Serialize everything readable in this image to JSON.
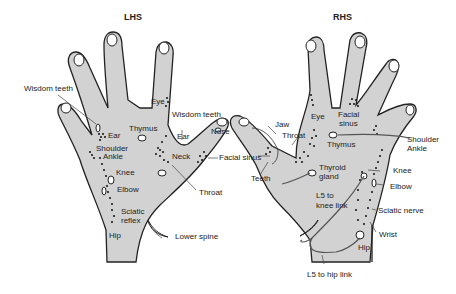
{
  "titles": {
    "left": "LHS",
    "right": "RHS"
  },
  "colors": {
    "hand_fill": "#d2d2d2",
    "outline": "#222222",
    "dots": "#111111",
    "link_line": "#555555"
  },
  "left_hand": {
    "labels": {
      "wisdom_teeth_1": "Wisdom teeth",
      "eye": "Eye",
      "wisdom_teeth_2": "Wisdom teeth",
      "ear_1": "Ear",
      "thymus": "Thymus",
      "ear_2": "Ear",
      "nose": "Nose",
      "shoulder": "Shoulder",
      "ankle": "Ankle",
      "neck": "Neck",
      "facial_sinus": "Facial sinus",
      "knee": "Knee",
      "elbow": "Elbow",
      "throat": "Throat",
      "sciatic": "Sciatic",
      "reflex": "reflex",
      "hip": "Hip",
      "lower_spine": "Lower spine"
    }
  },
  "right_hand": {
    "labels": {
      "jaw": "Jaw",
      "throat": "Throat",
      "eye": "Eye",
      "facial": "Facial",
      "sinus": "sinus",
      "thymus": "Thymus",
      "shoulder": "Shoulder",
      "ankle": "Ankle",
      "teeth": "Teeth",
      "thyroid": "Thyroid",
      "gland": "gland",
      "knee": "Knee",
      "elbow": "Elbow",
      "l5_knee_1": "L5 to",
      "l5_knee_2": "knee link",
      "sciatic_nerve": "Sciatic nerve",
      "wrist": "Wrist",
      "hip": "Hip",
      "l5_hip": "L5 to hip link"
    }
  }
}
